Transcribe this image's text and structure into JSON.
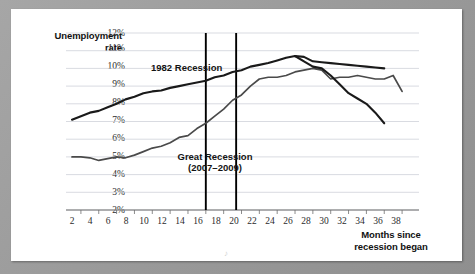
{
  "chart_data": {
    "type": "line",
    "title": "",
    "xlabel": "Months since\nrecession began",
    "ylabel": "Unemployment\nrate",
    "xlim": [
      1,
      39
    ],
    "ylim": [
      2,
      12
    ],
    "ytick_labels": [
      "2%",
      "3%",
      "4%",
      "5%",
      "6%",
      "7%",
      "8%",
      "9%",
      "10%",
      "11%",
      "12%"
    ],
    "ytick_values": [
      2,
      3,
      4,
      5,
      6,
      7,
      8,
      9,
      10,
      11,
      12
    ],
    "xtick_labels": [
      "2",
      "4",
      "6",
      "8",
      "10",
      "12",
      "14",
      "16",
      "18",
      "20",
      "22",
      "24",
      "26",
      "28",
      "30",
      "32",
      "34",
      "36",
      "38"
    ],
    "xtick_values": [
      2,
      4,
      6,
      8,
      10,
      12,
      14,
      16,
      18,
      20,
      22,
      24,
      26,
      28,
      30,
      32,
      34,
      36,
      38
    ],
    "grid": "horizontal",
    "legend": "inline-annotations",
    "annotations": [
      {
        "name": "1982 Recession",
        "text": "1982 Recession",
        "x": 9,
        "y": 10.2
      },
      {
        "name": "Great Recession",
        "text": "Great Recession\n(2007–2009)",
        "x": 11.5,
        "y": 4.85
      }
    ],
    "vertical_markers": [
      {
        "name": "marker-month-16",
        "x": 16
      },
      {
        "name": "marker-month-19",
        "x": 19.4
      }
    ],
    "series": [
      {
        "name": "1982 Recession",
        "color": "#1a1a1a",
        "x": [
          1,
          2,
          3,
          4,
          5,
          6,
          7,
          8,
          9,
          10,
          11,
          12,
          13,
          14,
          15,
          16,
          17,
          18,
          19,
          20,
          21,
          22,
          23,
          24,
          25,
          26,
          27,
          28,
          29,
          30,
          31,
          32,
          33,
          34,
          35,
          36
        ],
        "values": [
          7.1,
          7.3,
          7.5,
          7.6,
          7.8,
          8.0,
          8.25,
          8.4,
          8.6,
          8.7,
          8.75,
          8.9,
          9.0,
          9.1,
          9.2,
          9.3,
          9.5,
          9.6,
          9.8,
          9.9,
          10.1,
          10.2,
          10.3,
          10.45,
          10.6,
          10.7,
          10.65,
          10.4,
          10.35,
          10.3,
          10.25,
          10.2,
          10.15,
          10.1,
          10.05,
          10.0
        ]
      },
      {
        "name": "Great Recession (2007-2009)",
        "color": "#4a4a4a",
        "x": [
          1,
          2,
          3,
          4,
          5,
          6,
          7,
          8,
          9,
          10,
          11,
          12,
          13,
          14,
          15,
          16,
          17,
          18,
          19,
          20,
          21,
          22,
          23,
          24,
          25,
          26,
          27,
          28,
          29,
          30,
          31,
          32,
          33,
          34,
          35,
          36,
          37,
          38
        ],
        "values": [
          5.0,
          5.0,
          4.95,
          4.8,
          4.9,
          5.0,
          4.95,
          5.1,
          5.3,
          5.5,
          5.6,
          5.8,
          6.1,
          6.2,
          6.6,
          6.9,
          7.3,
          7.7,
          8.2,
          8.5,
          9.0,
          9.4,
          9.5,
          9.5,
          9.6,
          9.8,
          9.9,
          10.0,
          9.9,
          9.4,
          9.5,
          9.5,
          9.6,
          9.5,
          9.4,
          9.4,
          9.6,
          8.7
        ]
      }
    ],
    "series_declining": [
      {
        "name": "1982 Recession tail",
        "x": [
          26,
          27,
          28,
          29,
          30,
          31,
          32,
          33,
          34,
          35,
          36
        ],
        "values": [
          10.7,
          10.4,
          10.1,
          10.0,
          9.6,
          9.1,
          8.6,
          8.3,
          8.0,
          7.5,
          6.9
        ]
      }
    ]
  },
  "figure": {
    "artifact_mark": "♪"
  }
}
